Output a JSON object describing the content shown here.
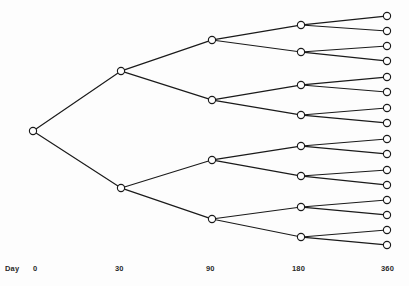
{
  "figure": {
    "background_color": "#fdfdfd",
    "line_color": "#1a1a1a",
    "node_fill_color": "#ffffff",
    "text_color": "#2a2a2a"
  },
  "axis": {
    "name": "Day",
    "name_x": 5,
    "name_y": 264,
    "ticks": [
      {
        "label": "0",
        "x": 33,
        "y": 264
      },
      {
        "label": "30",
        "x": 115,
        "y": 264
      },
      {
        "label": "90",
        "x": 206,
        "y": 264
      },
      {
        "label": "180",
        "x": 292,
        "y": 264
      },
      {
        "label": "360",
        "x": 381,
        "y": 264
      }
    ]
  },
  "chart_data": {
    "type": "diagram",
    "subtype": "binary-tree",
    "title": "",
    "xlabel": "Day",
    "ylabel": "",
    "levels": [
      0,
      30,
      90,
      180,
      360
    ],
    "nodes_per_level": [
      1,
      2,
      4,
      8,
      16
    ],
    "branching_factor": 2,
    "total_nodes": 31,
    "node_radius": 3.6,
    "columns_x": [
      33,
      121,
      212,
      301,
      387
    ],
    "nodes": {
      "day0": [
        {
          "id": "r",
          "x": 33,
          "y": 131
        }
      ],
      "day30": [
        {
          "id": "a",
          "x": 121,
          "y": 71,
          "parent": "r"
        },
        {
          "id": "b",
          "x": 121,
          "y": 188,
          "parent": "r"
        }
      ],
      "day90": [
        {
          "id": "a0",
          "x": 212,
          "y": 40,
          "parent": "a"
        },
        {
          "id": "a1",
          "x": 212,
          "y": 100,
          "parent": "a"
        },
        {
          "id": "b0",
          "x": 212,
          "y": 160,
          "parent": "b"
        },
        {
          "id": "b1",
          "x": 212,
          "y": 219,
          "parent": "b"
        }
      ],
      "day180": [
        {
          "id": "a00",
          "x": 301,
          "y": 25,
          "parent": "a0"
        },
        {
          "id": "a01",
          "x": 301,
          "y": 52,
          "parent": "a0"
        },
        {
          "id": "a10",
          "x": 301,
          "y": 85,
          "parent": "a1"
        },
        {
          "id": "a11",
          "x": 301,
          "y": 115,
          "parent": "a1"
        },
        {
          "id": "b00",
          "x": 301,
          "y": 146,
          "parent": "b0"
        },
        {
          "id": "b01",
          "x": 301,
          "y": 176,
          "parent": "b0"
        },
        {
          "id": "b10",
          "x": 301,
          "y": 207,
          "parent": "b1"
        },
        {
          "id": "b11",
          "x": 301,
          "y": 237,
          "parent": "b1"
        }
      ],
      "day360": [
        {
          "id": "a000",
          "x": 387,
          "y": 16,
          "parent": "a00"
        },
        {
          "id": "a001",
          "x": 387,
          "y": 31,
          "parent": "a00"
        },
        {
          "id": "a010",
          "x": 387,
          "y": 46,
          "parent": "a01"
        },
        {
          "id": "a011",
          "x": 387,
          "y": 61,
          "parent": "a01"
        },
        {
          "id": "a100",
          "x": 387,
          "y": 77,
          "parent": "a10"
        },
        {
          "id": "a101",
          "x": 387,
          "y": 92,
          "parent": "a10"
        },
        {
          "id": "a110",
          "x": 387,
          "y": 108,
          "parent": "a11"
        },
        {
          "id": "a111",
          "x": 387,
          "y": 123,
          "parent": "a11"
        },
        {
          "id": "b000",
          "x": 387,
          "y": 139,
          "parent": "b00"
        },
        {
          "id": "b001",
          "x": 387,
          "y": 154,
          "parent": "b00"
        },
        {
          "id": "b010",
          "x": 387,
          "y": 170,
          "parent": "b01"
        },
        {
          "id": "b011",
          "x": 387,
          "y": 185,
          "parent": "b01"
        },
        {
          "id": "b100",
          "x": 387,
          "y": 200,
          "parent": "b10"
        },
        {
          "id": "b101",
          "x": 387,
          "y": 215,
          "parent": "b10"
        },
        {
          "id": "b110",
          "x": 387,
          "y": 230,
          "parent": "b11"
        },
        {
          "id": "b111",
          "x": 387,
          "y": 245,
          "parent": "b11"
        }
      ]
    }
  }
}
